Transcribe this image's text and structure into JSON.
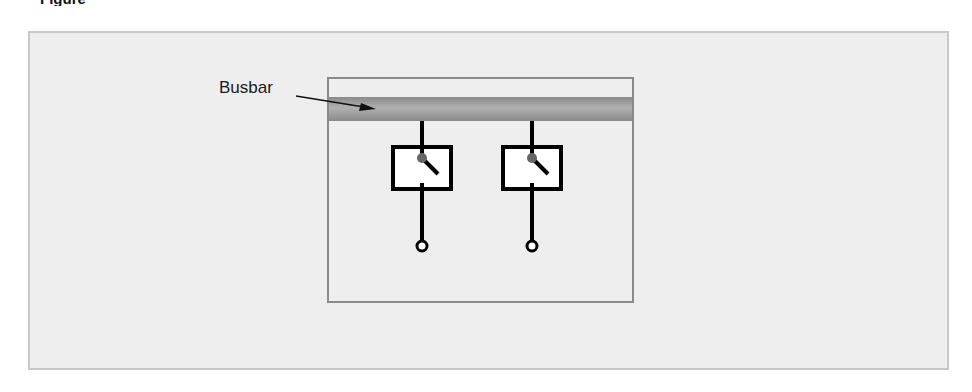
{
  "figure": {
    "caption_clipped": "Figure",
    "panel_fill": "#eeeeee",
    "panel_border": "#c8c8c8"
  },
  "diagram": {
    "busbar_label": "Busbar",
    "busbar_color": "#9a9a9a",
    "enclosure_border": "#888888",
    "switch_count": 2,
    "switches": [
      {
        "name": "switch-1",
        "x": 422,
        "state": "open"
      },
      {
        "name": "switch-2",
        "x": 532,
        "state": "open"
      }
    ],
    "pivot_color": "#666666",
    "line_color": "#000000",
    "terminal_symbol": "open-circle"
  }
}
